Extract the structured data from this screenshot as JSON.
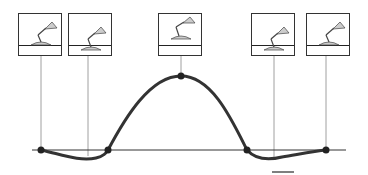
{
  "diagram": {
    "baseline_y": 150,
    "baseline": {
      "x1": 32,
      "x2": 346
    },
    "frames": [
      {
        "id": "frame-1",
        "x": 18,
        "y": 13,
        "pose": "crouched",
        "line_x": 41
      },
      {
        "id": "frame-2",
        "x": 68,
        "y": 13,
        "pose": "rising",
        "line_x": 88
      },
      {
        "id": "frame-3",
        "x": 158,
        "y": 13,
        "pose": "airborne",
        "line_x": 181
      },
      {
        "id": "frame-4",
        "x": 251,
        "y": 13,
        "pose": "landing",
        "line_x": 274
      },
      {
        "id": "frame-5",
        "x": 306,
        "y": 13,
        "pose": "crouched",
        "line_x": 326
      }
    ],
    "keypoints": [
      {
        "x": 41,
        "y": 150
      },
      {
        "x": 108,
        "y": 150
      },
      {
        "x": 181,
        "y": 76
      },
      {
        "x": 247,
        "y": 150
      },
      {
        "x": 326,
        "y": 150
      }
    ],
    "colors": {
      "curve": "#333333",
      "guides": "#777777",
      "frame_border": "#333333",
      "lamp_fill": "#cccccc"
    }
  }
}
